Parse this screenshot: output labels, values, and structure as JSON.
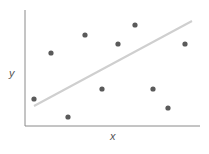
{
  "chart_data": {
    "type": "scatter",
    "title": "",
    "xlabel": "x",
    "ylabel": "y",
    "grid": false,
    "legend": null,
    "series": [
      {
        "name": "points",
        "points": [
          {
            "x": 34,
            "y": 99
          },
          {
            "x": 51,
            "y": 53
          },
          {
            "x": 68,
            "y": 117
          },
          {
            "x": 85,
            "y": 35
          },
          {
            "x": 102,
            "y": 89
          },
          {
            "x": 118,
            "y": 44
          },
          {
            "x": 135,
            "y": 25
          },
          {
            "x": 153,
            "y": 89
          },
          {
            "x": 168,
            "y": 108
          },
          {
            "x": 185,
            "y": 44
          }
        ]
      }
    ],
    "trendline": {
      "x1": 34,
      "y1": 106,
      "x2": 192,
      "y2": 21
    },
    "axes": {
      "origin_x": 25,
      "origin_y": 126,
      "x_end": 200,
      "y_top": 10
    }
  }
}
